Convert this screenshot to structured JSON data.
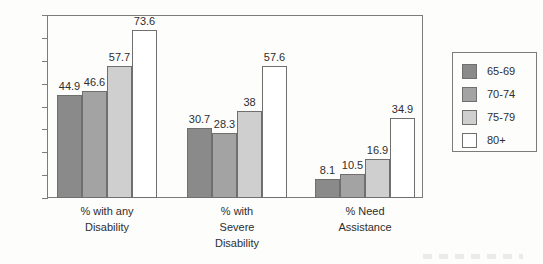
{
  "chart_data": {
    "type": "bar",
    "title": "",
    "subtitle": "",
    "xlabel": "",
    "ylabel": "",
    "ylim": [
      0,
      80
    ],
    "yticks": [
      0,
      10,
      20,
      30,
      40,
      50,
      60,
      70,
      80
    ],
    "grid": false,
    "legend_position": "right",
    "categories": [
      "% with any\nDisability",
      "% with\nSevere\nDisability",
      "% Need\nAssistance"
    ],
    "category_lines": [
      [
        "% with any",
        "Disability"
      ],
      [
        "% with",
        "Severe",
        "Disability"
      ],
      [
        "% Need",
        "Assistance"
      ]
    ],
    "series": [
      {
        "name": "65-69",
        "color": "#8a8a8a",
        "values": [
          44.9,
          30.7,
          8.1
        ],
        "labels": [
          "44.9",
          "30.7",
          "8.1"
        ]
      },
      {
        "name": "70-74",
        "color": "#a3a3a3",
        "values": [
          46.6,
          28.3,
          10.5
        ],
        "labels": [
          "46.6",
          "28.3",
          "10.5"
        ]
      },
      {
        "name": "75-79",
        "color": "#cfcfcf",
        "values": [
          57.7,
          38.0,
          16.9
        ],
        "labels": [
          "57.7",
          "38",
          "16.9"
        ]
      },
      {
        "name": "80+",
        "color": "#ffffff",
        "values": [
          73.6,
          57.6,
          34.9
        ],
        "labels": [
          "73.6",
          "57.6",
          "34.9"
        ]
      }
    ]
  },
  "legend": {
    "entries": [
      {
        "label": "65-69",
        "color": "#8a8a8a"
      },
      {
        "label": "70-74",
        "color": "#a3a3a3"
      },
      {
        "label": "75-79",
        "color": "#cfcfcf"
      },
      {
        "label": "80+",
        "color": "#ffffff"
      }
    ]
  },
  "axis": {
    "y_tick_labels": [
      "80",
      "70",
      "60",
      "50",
      "40",
      "30",
      "20",
      "10",
      "0"
    ]
  },
  "colors": {
    "axis_line": "#7c7c7c",
    "bar_outline": "#6f6f6f",
    "text": "#2e2e2e",
    "background": "#fdfdfc"
  }
}
